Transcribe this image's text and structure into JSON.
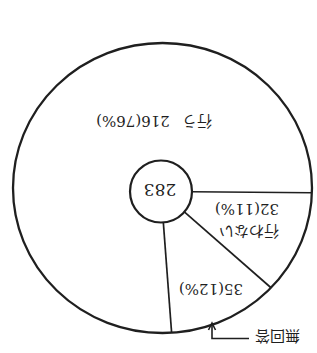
{
  "chart_data": {
    "type": "pie",
    "title": "",
    "total": 283,
    "center_label": "283",
    "slices": [
      {
        "name": "行う",
        "value": 216,
        "percent": 76,
        "value_label": "216(76%)"
      },
      {
        "name": "行わない",
        "value": 32,
        "percent": 11,
        "value_label": "32(11%)"
      },
      {
        "name": "無回答",
        "value": 35,
        "percent": 12,
        "value_label": "35(12%)"
      }
    ],
    "legend": "none",
    "annotations": [
      {
        "text": "無回答",
        "type": "callout-arrow",
        "target_slice": "無回答"
      }
    ]
  },
  "colors": {
    "ink": "#1f1f1f",
    "slice_fill": "#ffffff",
    "background": "#ffffff"
  }
}
